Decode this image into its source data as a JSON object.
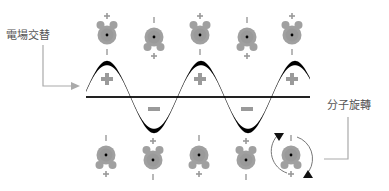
{
  "labels": {
    "alternating_field": "電場交替",
    "molecular_rotation": "分子旋轉"
  },
  "signs": {
    "plus": "+",
    "minus": "−",
    "dash": "I"
  },
  "colors": {
    "molecule": "#a0a0a0",
    "wave": "#000000",
    "axis": "#222222",
    "leader_line": "#aaaaaa",
    "label_text": "#555555",
    "sign": "#9a9a9a"
  },
  "top_row": [
    {
      "hydrogens": "up"
    },
    {
      "hydrogens": "down"
    },
    {
      "hydrogens": "up"
    },
    {
      "hydrogens": "down"
    },
    {
      "hydrogens": "up"
    }
  ],
  "bottom_row": [
    {
      "hydrogens": "down"
    },
    {
      "hydrogens": "up"
    },
    {
      "hydrogens": "down"
    },
    {
      "hydrogens": "up"
    },
    {
      "hydrogens": "down",
      "rotating": true
    }
  ],
  "wave_regions": [
    {
      "polarity": "positive"
    },
    {
      "polarity": "negative"
    },
    {
      "polarity": "positive"
    },
    {
      "polarity": "negative"
    },
    {
      "polarity": "positive"
    }
  ]
}
